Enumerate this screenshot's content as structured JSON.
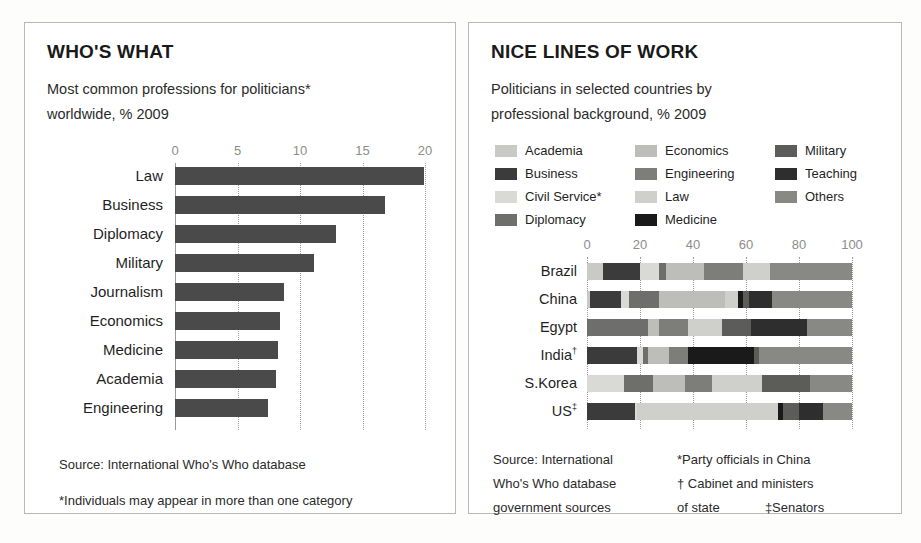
{
  "left": {
    "title": "WHO'S WHAT",
    "subtitle_line1": "Most common professions for politicians*",
    "subtitle_line2": "worldwide, % 2009",
    "source": "Source: International Who's Who database",
    "footnote": "*Individuals may appear in more than one category",
    "chart_data": {
      "type": "bar",
      "orientation": "horizontal",
      "title": "Most common professions for politicians* worldwide, % 2009",
      "xlabel": "",
      "ylabel": "",
      "xlim": [
        0,
        20
      ],
      "ticks": [
        0,
        5,
        10,
        15,
        20
      ],
      "grid": true,
      "bar_color": "#4a4a4a",
      "categories": [
        "Law",
        "Business",
        "Diplomacy",
        "Military",
        "Journalism",
        "Economics",
        "Medicine",
        "Academia",
        "Engineering"
      ],
      "values": [
        19.9,
        16.8,
        12.9,
        11.1,
        8.7,
        8.4,
        8.2,
        8.1,
        7.4
      ]
    }
  },
  "right": {
    "title": "NICE LINES OF WORK",
    "subtitle_line1": "Politicians in selected countries by",
    "subtitle_line2": "professional background, % 2009",
    "source_line1": "Source: International",
    "source_line2": "Who's Who database",
    "source_line3": "government sources",
    "note_line1": "*Party officials in China",
    "note_line2": "† Cabinet and ministers",
    "note_line3a": "of state",
    "note_line3b": "‡Senators",
    "legend_columns": [
      [
        {
          "label": "Academia",
          "color": "#c9c9c5"
        },
        {
          "label": "Business",
          "color": "#3b3b3b"
        },
        {
          "label": "Civil Service*",
          "color": "#d9d9d5"
        },
        {
          "label": "Diplomacy",
          "color": "#6e6e6c"
        }
      ],
      [
        {
          "label": "Economics",
          "color": "#bdbdb9"
        },
        {
          "label": "Engineering",
          "color": "#7d7d7a"
        },
        {
          "label": "Law",
          "color": "#cfcfcb"
        },
        {
          "label": "Medicine",
          "color": "#1a1a1a"
        }
      ],
      [
        {
          "label": "Military",
          "color": "#5c5c5a"
        },
        {
          "label": "Teaching",
          "color": "#2e2e2e"
        },
        {
          "label": "Others",
          "color": "#888885"
        }
      ]
    ],
    "chart_data": {
      "type": "bar",
      "subtype": "stacked-horizontal-100",
      "title": "Politicians in selected countries by professional background, % 2009",
      "xlabel": "",
      "ylabel": "",
      "xlim": [
        0,
        100
      ],
      "ticks": [
        0,
        20,
        40,
        60,
        80,
        100
      ],
      "grid": true,
      "categories": [
        "Academia",
        "Business",
        "Civil Service*",
        "Diplomacy",
        "Economics",
        "Engineering",
        "Law",
        "Medicine",
        "Military",
        "Teaching",
        "Others"
      ],
      "colors": [
        "#c9c9c5",
        "#3b3b3b",
        "#d9d9d5",
        "#6e6e6c",
        "#bdbdb9",
        "#7d7d7a",
        "#cfcfcb",
        "#1a1a1a",
        "#5c5c5a",
        "#2e2e2e",
        "#888885"
      ],
      "rows": [
        {
          "label": "Brazil",
          "label_mark": "",
          "values": [
            6,
            14,
            7,
            3,
            14,
            15,
            10,
            0,
            0,
            0,
            31
          ]
        },
        {
          "label": "China",
          "label_mark": "",
          "values": [
            1,
            12,
            3,
            11,
            25,
            0,
            5,
            2,
            2,
            9,
            30
          ]
        },
        {
          "label": "Egypt",
          "label_mark": "",
          "values": [
            0,
            0,
            0,
            23,
            4,
            11,
            13,
            0,
            11,
            21,
            17
          ]
        },
        {
          "label": "India",
          "label_mark": "†",
          "values": [
            0,
            19,
            2,
            2,
            8,
            7,
            0,
            25,
            2,
            0,
            35
          ]
        },
        {
          "label": "S.Korea",
          "label_mark": "",
          "values": [
            0,
            0,
            14,
            11,
            12,
            10,
            19,
            0,
            18,
            0,
            16
          ]
        },
        {
          "label": "US",
          "label_mark": "‡",
          "values": [
            0,
            18,
            1,
            0,
            0,
            0,
            53,
            2,
            6,
            9,
            11
          ]
        }
      ]
    }
  }
}
